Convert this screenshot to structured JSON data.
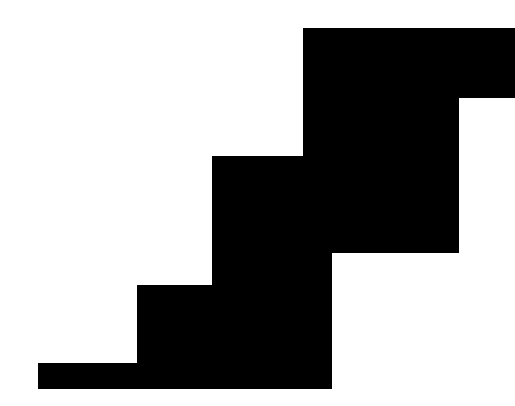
{
  "canvas": {
    "width": 515,
    "height": 406,
    "background_color": "#ffffff",
    "title": "Staircase Silhouette"
  },
  "shape": {
    "name": "staircase-silhouette",
    "fill_color": "#000000",
    "stroke_color": "none",
    "description": "Solid black descending staircase / step polygon on white background",
    "step_count": 3,
    "points": "38,363 137,363 137,285 212,285 212,156 303,156 303,28 515,28 515,98 459,98 459,253 332,253 332,389 38,389",
    "vertices": [
      [
        38,
        363
      ],
      [
        137,
        363
      ],
      [
        137,
        285
      ],
      [
        212,
        285
      ],
      [
        212,
        156
      ],
      [
        303,
        156
      ],
      [
        303,
        28
      ],
      [
        515,
        28
      ],
      [
        515,
        98
      ],
      [
        459,
        98
      ],
      [
        459,
        253
      ],
      [
        332,
        253
      ],
      [
        332,
        389
      ],
      [
        38,
        389
      ]
    ]
  }
}
